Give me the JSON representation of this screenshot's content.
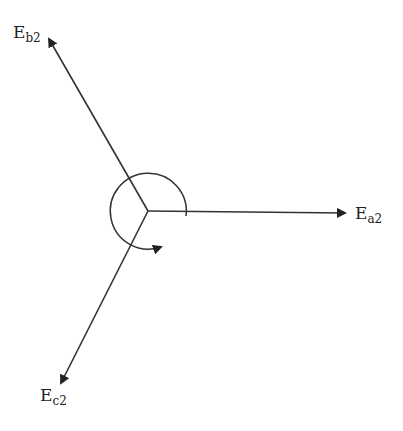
{
  "diagram": {
    "type": "phasor",
    "origin": {
      "x": 148,
      "y": 211
    },
    "color": "#222222",
    "phasors": [
      {
        "id": "a",
        "base": "E",
        "sub": "a2",
        "tip": {
          "x": 345,
          "y": 213
        },
        "label_pos": {
          "x": 355,
          "y": 206
        }
      },
      {
        "id": "b",
        "base": "E",
        "sub": "b2",
        "tip": {
          "x": 49,
          "y": 39
        },
        "label_pos": {
          "x": 13,
          "y": 14
        }
      },
      {
        "id": "c",
        "base": "E",
        "sub": "c2",
        "tip": {
          "x": 61,
          "y": 383
        },
        "label_pos": {
          "x": 40,
          "y": 386
        }
      }
    ],
    "rotation_arc": {
      "radius": 38,
      "direction": "counter-clockwise",
      "start_angle_deg": -8,
      "end_angle_deg": 235
    }
  }
}
